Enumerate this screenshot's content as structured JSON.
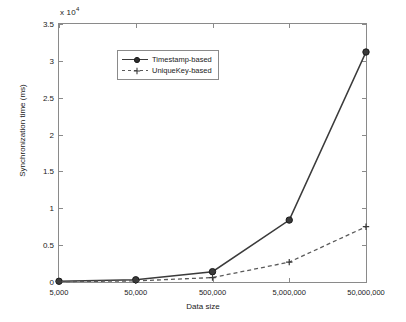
{
  "chart_data": {
    "type": "line",
    "title": "",
    "xlabel": "Data size",
    "ylabel": "Synchronization time (ms)",
    "y_exponent_label": "x 10",
    "y_exponent_power": "4",
    "categories": [
      "5,000",
      "50,000",
      "500,000",
      "5,000,000",
      "50,000,000"
    ],
    "x_positions": [
      0,
      1,
      2,
      3,
      4
    ],
    "xlim": [
      0,
      4
    ],
    "ylim": [
      0,
      35000
    ],
    "yticks": [
      0,
      5000,
      10000,
      15000,
      20000,
      25000,
      30000,
      35000
    ],
    "ytick_labels": [
      "0",
      "0.5",
      "1",
      "1.5",
      "2",
      "2.5",
      "3",
      "3.5"
    ],
    "grid": false,
    "legend_position": "upper left",
    "series": [
      {
        "name": "Timestamp-based",
        "style": "solid",
        "marker": "circle",
        "color": "#3b3b3b",
        "values": [
          100,
          300,
          1400,
          8400,
          31200
        ]
      },
      {
        "name": "UniqueKey-based",
        "style": "dashed",
        "marker": "plus",
        "color": "#5a5a5a",
        "values": [
          50,
          150,
          600,
          2700,
          7500
        ]
      }
    ]
  },
  "legend": {
    "items": [
      {
        "label": "Timestamp-based"
      },
      {
        "label": "UniqueKey-based"
      }
    ]
  },
  "axes": {
    "x_title": "Data size",
    "y_title": "Synchronization time (ms)",
    "x_tick_labels": [
      "5,000",
      "50,000",
      "500,000",
      "5,000,000",
      "50,000,000"
    ],
    "y_tick_labels": [
      "0",
      "0.5",
      "1",
      "1.5",
      "2",
      "2.5",
      "3",
      "3.5"
    ],
    "exponent_prefix": "x 10",
    "exponent_power": "4"
  }
}
